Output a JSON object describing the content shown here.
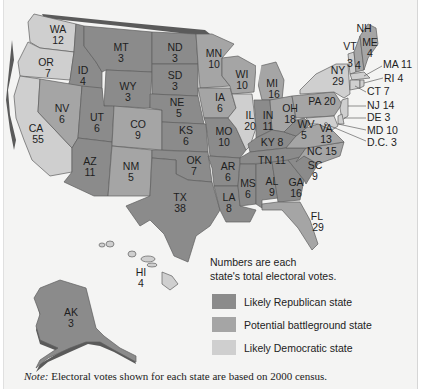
{
  "map": {
    "title": "Electoral votes by state (2000 census)",
    "states": {
      "WA": {
        "abbr": "WA",
        "votes": "12",
        "category": "dem"
      },
      "OR": {
        "abbr": "OR",
        "votes": "7",
        "category": "dem"
      },
      "CA": {
        "abbr": "CA",
        "votes": "55",
        "category": "dem"
      },
      "ID": {
        "abbr": "ID",
        "votes": "4",
        "category": "rep"
      },
      "NV": {
        "abbr": "NV",
        "votes": "6",
        "category": "bat"
      },
      "MT": {
        "abbr": "MT",
        "votes": "3",
        "category": "rep"
      },
      "WY": {
        "abbr": "WY",
        "votes": "3",
        "category": "rep"
      },
      "UT": {
        "abbr": "UT",
        "votes": "6",
        "category": "rep"
      },
      "AZ": {
        "abbr": "AZ",
        "votes": "11",
        "category": "rep"
      },
      "CO": {
        "abbr": "CO",
        "votes": "9",
        "category": "bat"
      },
      "NM": {
        "abbr": "NM",
        "votes": "5",
        "category": "bat"
      },
      "ND": {
        "abbr": "ND",
        "votes": "3",
        "category": "rep"
      },
      "SD": {
        "abbr": "SD",
        "votes": "3",
        "category": "rep"
      },
      "NE": {
        "abbr": "NE",
        "votes": "5",
        "category": "rep"
      },
      "KS": {
        "abbr": "KS",
        "votes": "6",
        "category": "rep"
      },
      "OK": {
        "abbr": "OK",
        "votes": "7",
        "category": "rep"
      },
      "TX": {
        "abbr": "TX",
        "votes": "38",
        "category": "rep"
      },
      "MN": {
        "abbr": "MN",
        "votes": "10",
        "category": "bat"
      },
      "IA": {
        "abbr": "IA",
        "votes": "6",
        "category": "bat"
      },
      "MO": {
        "abbr": "MO",
        "votes": "10",
        "category": "rep"
      },
      "AR": {
        "abbr": "AR",
        "votes": "6",
        "category": "rep"
      },
      "LA": {
        "abbr": "LA",
        "votes": "8",
        "category": "rep"
      },
      "WI": {
        "abbr": "WI",
        "votes": "10",
        "category": "bat"
      },
      "IL": {
        "abbr": "IL",
        "votes": "20",
        "category": "dem"
      },
      "MI": {
        "abbr": "MI",
        "votes": "16",
        "category": "bat"
      },
      "IN": {
        "abbr": "IN",
        "votes": "11",
        "category": "rep"
      },
      "OH": {
        "abbr": "OH",
        "votes": "18",
        "category": "bat"
      },
      "KY": {
        "abbr": "KY",
        "votes": "8",
        "category": "rep"
      },
      "TN": {
        "abbr": "TN",
        "votes": "11",
        "category": "rep"
      },
      "MS": {
        "abbr": "MS",
        "votes": "6",
        "category": "rep"
      },
      "AL": {
        "abbr": "AL",
        "votes": "9",
        "category": "rep"
      },
      "GA": {
        "abbr": "GA",
        "votes": "16",
        "category": "rep"
      },
      "FL": {
        "abbr": "FL",
        "votes": "29",
        "category": "bat"
      },
      "SC": {
        "abbr": "SC",
        "votes": "9",
        "category": "rep"
      },
      "NC": {
        "abbr": "NC",
        "votes": "15",
        "category": "bat"
      },
      "VA": {
        "abbr": "VA",
        "votes": "13",
        "category": "bat"
      },
      "WV": {
        "abbr": "WV",
        "votes": "5",
        "category": "rep"
      },
      "PA": {
        "abbr": "PA",
        "votes": "20",
        "category": "bat"
      },
      "NY": {
        "abbr": "NY",
        "votes": "29",
        "category": "dem"
      },
      "VT": {
        "abbr": "VT",
        "votes": "3",
        "category": "dem"
      },
      "NH": {
        "abbr": "NH",
        "votes": "4",
        "category": "bat"
      },
      "ME": {
        "abbr": "ME",
        "votes": "4",
        "category": "bat"
      },
      "MA": {
        "abbr": "MA",
        "votes": "11",
        "category": "dem"
      },
      "RI": {
        "abbr": "RI",
        "votes": "4",
        "category": "dem"
      },
      "CT": {
        "abbr": "CT",
        "votes": "7",
        "category": "dem"
      },
      "NJ": {
        "abbr": "NJ",
        "votes": "14",
        "category": "dem"
      },
      "DE": {
        "abbr": "DE",
        "votes": "3",
        "category": "dem"
      },
      "MD": {
        "abbr": "MD",
        "votes": "10",
        "category": "dem"
      },
      "DC": {
        "abbr": "D.C.",
        "votes": "3",
        "category": "dem"
      },
      "HI": {
        "abbr": "HI",
        "votes": "4",
        "category": "dem"
      },
      "AK": {
        "abbr": "AK",
        "votes": "3",
        "category": "rep"
      }
    }
  },
  "legend": {
    "note_line1": "Numbers are each",
    "note_line2": "state's total electoral votes.",
    "items": [
      {
        "label": "Likely Republican state",
        "color": "#8b8b8b"
      },
      {
        "label": "Potential battleground state",
        "color": "#a5a5a5"
      },
      {
        "label": "Likely Democratic state",
        "color": "#cfcfcf"
      }
    ]
  },
  "footnote": {
    "prefix": "Note:",
    "text": " Electoral votes shown for each state are based on 2000 census."
  }
}
